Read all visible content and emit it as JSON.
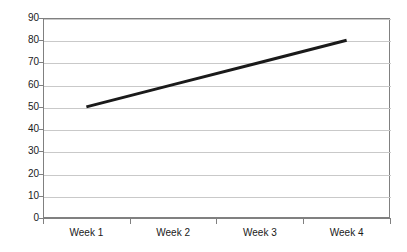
{
  "chart_data": {
    "type": "line",
    "title": "",
    "subtitle": "",
    "xlabel": "",
    "ylabel": "",
    "categories": [
      "Week 1",
      "Week 2",
      "Week 3",
      "Week 4"
    ],
    "series": [
      {
        "name": "Series 1",
        "values": [
          50,
          60,
          70,
          80
        ],
        "color": "#1a1a1a",
        "line_width": 3,
        "markers": false
      }
    ],
    "ylim": [
      0,
      90
    ],
    "ytick_labels": [
      "90",
      "80",
      "70",
      "60",
      "50",
      "40",
      "30",
      "20",
      "10",
      "0"
    ],
    "ytick_values": [
      90,
      80,
      70,
      60,
      50,
      40,
      30,
      20,
      10,
      0
    ],
    "ytick_step": 10,
    "grid": {
      "horizontal": true,
      "vertical": false,
      "color": "#c9c9c9"
    },
    "legend": {
      "visible": false,
      "position": "none",
      "entries": []
    },
    "axis": {
      "border": true,
      "border_color": "#808080",
      "tick_marks": true
    },
    "annotations": [],
    "background": "#ffffff"
  }
}
